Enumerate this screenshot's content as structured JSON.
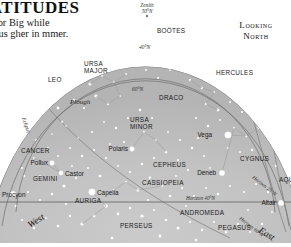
{
  "article": {
    "title": "LATITUDES",
    "body": "ugh (or Big while Cygnus gher in mmer. us is"
  },
  "header": {
    "looking_label_line1": "Looking",
    "looking_label_line2": "North"
  },
  "chart": {
    "zenith_label_line1": "Zenith",
    "zenith_label_line2": "50°N",
    "latitude_arcs": [
      {
        "label": "40°N"
      },
      {
        "label": "60°N"
      }
    ],
    "horizon_labels": [
      "Horizon 25°N",
      "Horizon 40°N",
      "Horizon 60°N"
    ],
    "ecliptic_label": "Ecliptic",
    "compass": {
      "west": "West",
      "east": "East"
    },
    "asterism_label": "Plough",
    "constellations": [
      {
        "name": "BOÖTES",
        "x": 157,
        "y": 33,
        "size": 6.4
      },
      {
        "name": "URSA MAJOR",
        "x": 84,
        "y": 66,
        "size": 6.4,
        "lines": [
          "URSA",
          "MAJOR"
        ]
      },
      {
        "name": "HERCULES",
        "x": 216,
        "y": 75,
        "size": 6.4
      },
      {
        "name": "DRACO",
        "x": 159,
        "y": 100,
        "size": 6.4
      },
      {
        "name": "LEO",
        "x": 48,
        "y": 82,
        "size": 6.4
      },
      {
        "name": "URSA MINOR",
        "x": 130,
        "y": 122,
        "size": 6.4,
        "lines": [
          "URSA",
          "MINOR"
        ]
      },
      {
        "name": "CANCER",
        "x": 21,
        "y": 153,
        "size": 6.4
      },
      {
        "name": "GEMINI",
        "x": 33,
        "y": 181,
        "size": 6.4
      },
      {
        "name": "CEPHEUS",
        "x": 153,
        "y": 167,
        "size": 6.4
      },
      {
        "name": "CASSIOPEIA",
        "x": 142,
        "y": 185,
        "size": 6.4
      },
      {
        "name": "CYGNUS",
        "x": 240,
        "y": 161,
        "size": 6.4
      },
      {
        "name": "AQUILA",
        "x": 279,
        "y": 182,
        "size": 6.4
      },
      {
        "name": "AURIGA",
        "x": 75,
        "y": 203,
        "size": 6.4
      },
      {
        "name": "PERSEUS",
        "x": 120,
        "y": 228,
        "size": 6.4
      },
      {
        "name": "ANDROMEDA",
        "x": 180,
        "y": 215,
        "size": 6.4
      },
      {
        "name": "PEGASUS",
        "x": 218,
        "y": 230,
        "size": 6.4
      }
    ],
    "stars_named": [
      {
        "name": "Vega",
        "x": 228,
        "y": 135,
        "mag": 3.3,
        "label_dx": -16,
        "label_dy": 2.5
      },
      {
        "name": "Deneb",
        "x": 222,
        "y": 173,
        "mag": 2.8,
        "label_dx": -16,
        "label_dy": 2.5
      },
      {
        "name": "Altair",
        "x": 281,
        "y": 203,
        "mag": 2.8,
        "label_dx": -16,
        "label_dy": 2.5
      },
      {
        "name": "Polaris",
        "x": 132,
        "y": 149,
        "mag": 2.4,
        "label_dx": -17,
        "label_dy": 2.5
      },
      {
        "name": "Pollux",
        "x": 52,
        "y": 163,
        "mag": 2.4,
        "label_dx": -16,
        "label_dy": 2.5
      },
      {
        "name": "Castor",
        "x": 61,
        "y": 173,
        "mag": 2.2,
        "label_dx": -14,
        "label_dy": 2.5
      },
      {
        "name": "Procyon",
        "x": 13,
        "y": 194,
        "mag": 2.8,
        "label_dx": -12,
        "label_dy": 3.0
      },
      {
        "name": "Capella",
        "x": 92,
        "y": 192,
        "mag": 3.3,
        "label_dx": 5,
        "label_dy": 2.5
      }
    ],
    "colors": {
      "sky_outer": "#b9b9b9",
      "sky_inner": "#c7c7c7",
      "sky_band": "#c2c2c2",
      "star": "#ffffff",
      "arc_line": "#6e6e6e",
      "horizon_line": "#5a5a5a",
      "label_text": "#1a1a1a",
      "page_background": "#ffffff"
    }
  }
}
